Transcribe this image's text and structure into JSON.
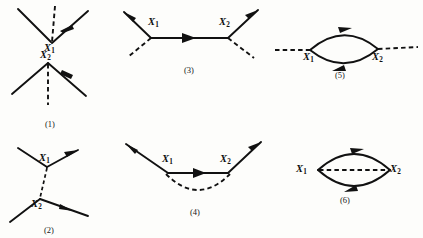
{
  "figure": {
    "kind": "feynman-diagram-set",
    "background_color": "#fdfdfb",
    "ink_color": "#111111",
    "vertex_label_1": "X",
    "vertex_label_1_sub": "1",
    "vertex_label_2": "X",
    "vertex_label_2_sub": "2"
  },
  "diagrams": [
    {
      "id": "diagram-1",
      "caption": "(1)",
      "description": "two disconnected three-line vertices, each with two solid lines and one dashed line",
      "labels": [
        {
          "name": "X",
          "sub": "1"
        },
        {
          "name": "X",
          "sub": "2"
        }
      ]
    },
    {
      "id": "diagram-2",
      "caption": "(2)",
      "description": "two vertices joined by a vertical dashed internal line, each vertex with an incoming and an outgoing solid line",
      "labels": [
        {
          "name": "X",
          "sub": "1"
        },
        {
          "name": "X",
          "sub": "2"
        }
      ]
    },
    {
      "id": "diagram-3",
      "caption": "(3)",
      "description": "horizontal solid internal line between two vertices, each with one outgoing solid line and one dashed external line",
      "labels": [
        {
          "name": "X",
          "sub": "1"
        },
        {
          "name": "X",
          "sub": "2"
        }
      ]
    },
    {
      "id": "diagram-4",
      "caption": "(4)",
      "description": "solid line entering from upper left through both vertices and leaving upper right, with a dashed arc below connecting the vertices",
      "labels": [
        {
          "name": "X",
          "sub": "1"
        },
        {
          "name": "X",
          "sub": "2"
        }
      ]
    },
    {
      "id": "diagram-5",
      "caption": "(5)",
      "description": "dashed external lines on both sides with a closed solid loop between the two vertices",
      "labels": [
        {
          "name": "X",
          "sub": "1"
        },
        {
          "name": "X",
          "sub": "2"
        }
      ]
    },
    {
      "id": "diagram-6",
      "caption": "(6)",
      "description": "closed solid loop between the two vertices with a dashed internal line through the middle",
      "labels": [
        {
          "name": "X",
          "sub": "1"
        },
        {
          "name": "X",
          "sub": "2"
        }
      ]
    }
  ]
}
